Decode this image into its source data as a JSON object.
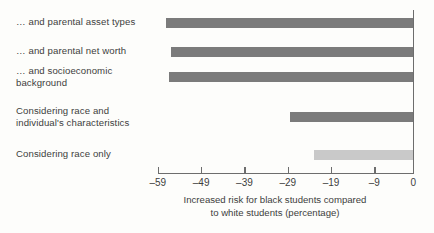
{
  "chart_data": {
    "type": "bar",
    "orientation": "horizontal",
    "title": "",
    "subtitle": "",
    "xlabel": "Increased risk for black students compared\nto white students (percentage)",
    "ylabel": "",
    "categories": [
      "… and parental asset types",
      "… and parental net worth",
      "… and socioeconomic\nbackground",
      "Considering race and\nindividual's characteristics",
      "Considering race only"
    ],
    "values": [
      -57,
      -56,
      -56.5,
      -28.5,
      -23
    ],
    "bar_colors": [
      "#7b7b7b",
      "#7b7b7b",
      "#7b7b7b",
      "#7b7b7b",
      "#c9c9c9"
    ],
    "xlim": [
      -59,
      0
    ],
    "xticks": [
      -59,
      -49,
      -39,
      -29,
      -19,
      -9,
      0
    ],
    "xtick_labels": [
      "–59",
      "–49",
      "–39",
      "–29",
      "–19",
      "–9",
      "0"
    ],
    "grid": false,
    "legend": "none",
    "axis_color": "#6d6d6d",
    "background_color": "#fdfdfb",
    "text_color": "#3d3d3d"
  },
  "bars": [
    {
      "label": "bar-parental-asset-types",
      "value": -57,
      "top": 18,
      "color": "#7b7b7b"
    },
    {
      "label": "bar-parental-net-worth",
      "value": -56,
      "top": 47,
      "color": "#7b7b7b"
    },
    {
      "label": "bar-socioeconomic-background",
      "value": -56.5,
      "top": 72,
      "color": "#7b7b7b"
    },
    {
      "label": "bar-race-and-characteristics",
      "value": -28.5,
      "top": 112,
      "color": "#7b7b7b"
    },
    {
      "label": "bar-race-only",
      "value": -23,
      "top": 150,
      "color": "#c9c9c9"
    }
  ],
  "label_positions": [
    18,
    45,
    68,
    108,
    148
  ]
}
